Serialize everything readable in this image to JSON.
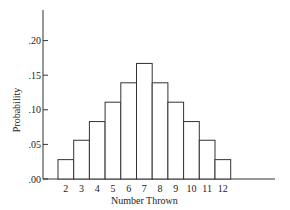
{
  "chart_data": {
    "type": "bar",
    "title": "",
    "xlabel": "Number Thrown",
    "ylabel": "Probability",
    "categories": [
      "2",
      "3",
      "4",
      "5",
      "6",
      "7",
      "8",
      "9",
      "10",
      "11",
      "12"
    ],
    "values": [
      0.028,
      0.056,
      0.083,
      0.111,
      0.139,
      0.167,
      0.139,
      0.111,
      0.083,
      0.056,
      0.028
    ],
    "yticks": [
      ".00",
      ".05",
      ".10",
      ".15",
      ".20"
    ],
    "ylim": [
      0,
      0.25
    ],
    "grid": false,
    "legend": "none"
  }
}
